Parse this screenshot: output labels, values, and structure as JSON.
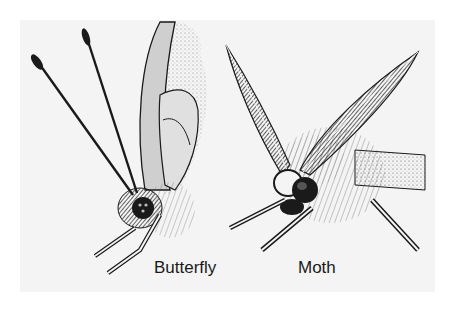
{
  "figure": {
    "background_color": "#ffffff",
    "panel_color": "#f4f4f4",
    "ink_color": "#1a1a1a",
    "subjects": [
      {
        "id": "butterfly",
        "label": "Butterfly",
        "antenna_type": "clubbed"
      },
      {
        "id": "moth",
        "label": "Moth",
        "antenna_type": "feathered"
      }
    ]
  }
}
